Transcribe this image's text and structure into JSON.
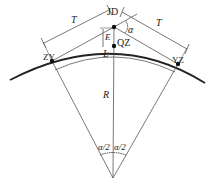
{
  "diagram": {
    "colors": {
      "line": "#555555",
      "curve": "#222222",
      "point": "#111111"
    },
    "points": {
      "jd": {
        "label": "JD",
        "x": 114,
        "y": 27
      },
      "qz": {
        "label": "QZ",
        "x": 114,
        "y": 46
      },
      "zy": {
        "label": "ZY",
        "x": 52,
        "y": 61
      },
      "yz": {
        "label": "YZ",
        "x": 178,
        "y": 64
      },
      "center": {
        "x": 113,
        "y": 178
      }
    },
    "labels": {
      "tangent_left": "T",
      "tangent_right": "T",
      "external": "E",
      "arc_length": "L",
      "radius": "R",
      "deflection": "α",
      "half_angle_left": "α/2",
      "half_angle_right": "α/2"
    }
  }
}
